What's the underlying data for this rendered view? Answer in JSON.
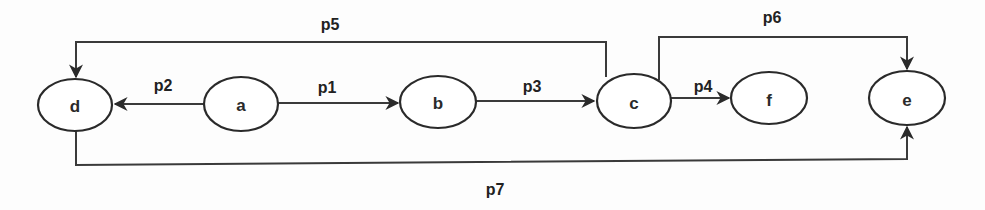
{
  "diagram": {
    "type": "directed-graph",
    "colors": {
      "background": "#fdfdfd",
      "stroke": "#2a2a2a",
      "text": "#222222"
    },
    "nodes": [
      {
        "id": "d",
        "label": "d",
        "cx": 75,
        "cy": 105,
        "rx": 37,
        "ry": 26
      },
      {
        "id": "a",
        "label": "a",
        "cx": 241,
        "cy": 104,
        "rx": 37,
        "ry": 27
      },
      {
        "id": "b",
        "label": "b",
        "cx": 438,
        "cy": 102,
        "rx": 38,
        "ry": 26
      },
      {
        "id": "c",
        "label": "c",
        "cx": 634,
        "cy": 101,
        "rx": 37,
        "ry": 27
      },
      {
        "id": "f",
        "label": "f",
        "cx": 769,
        "cy": 98,
        "rx": 38,
        "ry": 26
      },
      {
        "id": "e",
        "label": "e",
        "cx": 907,
        "cy": 98,
        "rx": 38,
        "ry": 27
      }
    ],
    "edges": [
      {
        "id": "p1",
        "label": "p1",
        "from": "a",
        "to": "b"
      },
      {
        "id": "p2",
        "label": "p2",
        "from": "a",
        "to": "d"
      },
      {
        "id": "p3",
        "label": "p3",
        "from": "b",
        "to": "c"
      },
      {
        "id": "p4",
        "label": "p4",
        "from": "c",
        "to": "f"
      },
      {
        "id": "p5",
        "label": "p5",
        "from": "c",
        "to": "d"
      },
      {
        "id": "p6",
        "label": "p6",
        "from": "c",
        "to": "e"
      },
      {
        "id": "p7",
        "label": "p7",
        "from": "d",
        "to": "e"
      }
    ]
  }
}
